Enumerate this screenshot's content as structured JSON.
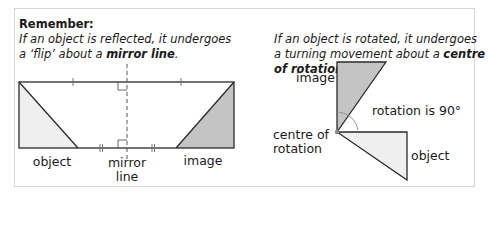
{
  "left_panel": {
    "heading": "Remember:",
    "line1": "If an object is reflected, it undergoes",
    "line2_pre": "a ‘flip’ about a ",
    "line2_bold": "mirror line",
    "line2_post": ".",
    "labels": {
      "object": "object",
      "mirror_line_1": "mirror",
      "mirror_line_2": "line",
      "image": "image"
    }
  },
  "right_panel": {
    "line1": "If an object is rotated, it undergoes",
    "line2_pre": "a turning movement about a ",
    "line2_bold": "centre",
    "line3_bold": "of rotation",
    "line3_post": ".",
    "labels": {
      "image": "image",
      "rotation": "rotation is 90°",
      "centre_1": "centre of",
      "centre_2": "rotation",
      "object": "object"
    }
  },
  "colors": {
    "object_fill": "#efefef",
    "image_fill": "#c4c4c4",
    "line": "#2a2a2a",
    "border": "#d6d6d6"
  }
}
